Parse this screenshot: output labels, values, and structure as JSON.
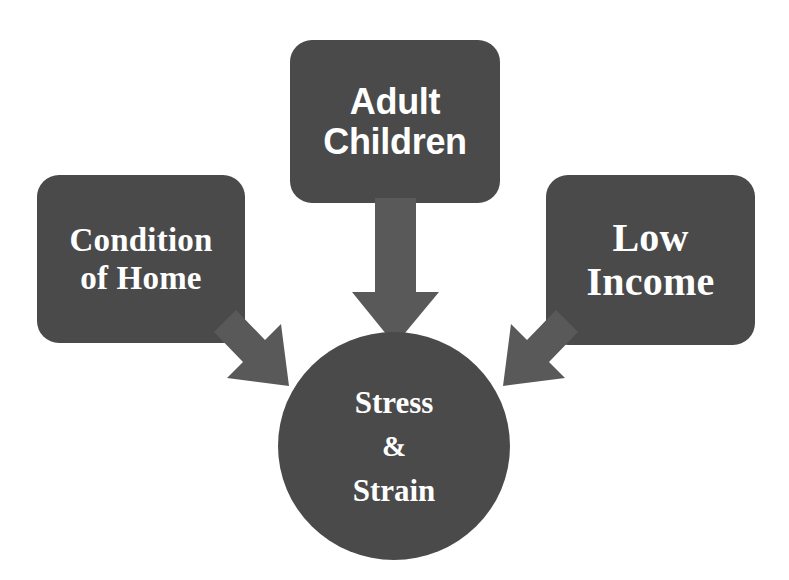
{
  "diagram": {
    "background_color": "#ffffff",
    "node_fill_color": "#4a4a4a",
    "arrow_fill_color": "#595959",
    "text_color": "#ffffff",
    "nodes": [
      {
        "id": "condition-of-home",
        "shape": "rounded-rectangle",
        "lines": [
          "Condition",
          "of Home"
        ],
        "text": "Condition of Home"
      },
      {
        "id": "adult-children",
        "shape": "rounded-rectangle",
        "lines": [
          "Adult",
          "Children"
        ],
        "text": "Adult Children"
      },
      {
        "id": "low-income",
        "shape": "rounded-rectangle",
        "lines": [
          "Low",
          "Income"
        ],
        "text": "Low Income"
      },
      {
        "id": "stress-strain",
        "shape": "ellipse",
        "lines": [
          "Stress",
          "&",
          "Strain"
        ],
        "text": "Stress & Strain"
      }
    ],
    "arrows": [
      {
        "id": "arrow-adult-children-to-stress",
        "from": "adult-children",
        "to": "stress-strain",
        "direction": "down"
      },
      {
        "id": "arrow-condition-of-home-to-stress",
        "from": "condition-of-home",
        "to": "stress-strain",
        "direction": "down-right"
      },
      {
        "id": "arrow-low-income-to-stress",
        "from": "low-income",
        "to": "stress-strain",
        "direction": "down-left"
      }
    ]
  }
}
